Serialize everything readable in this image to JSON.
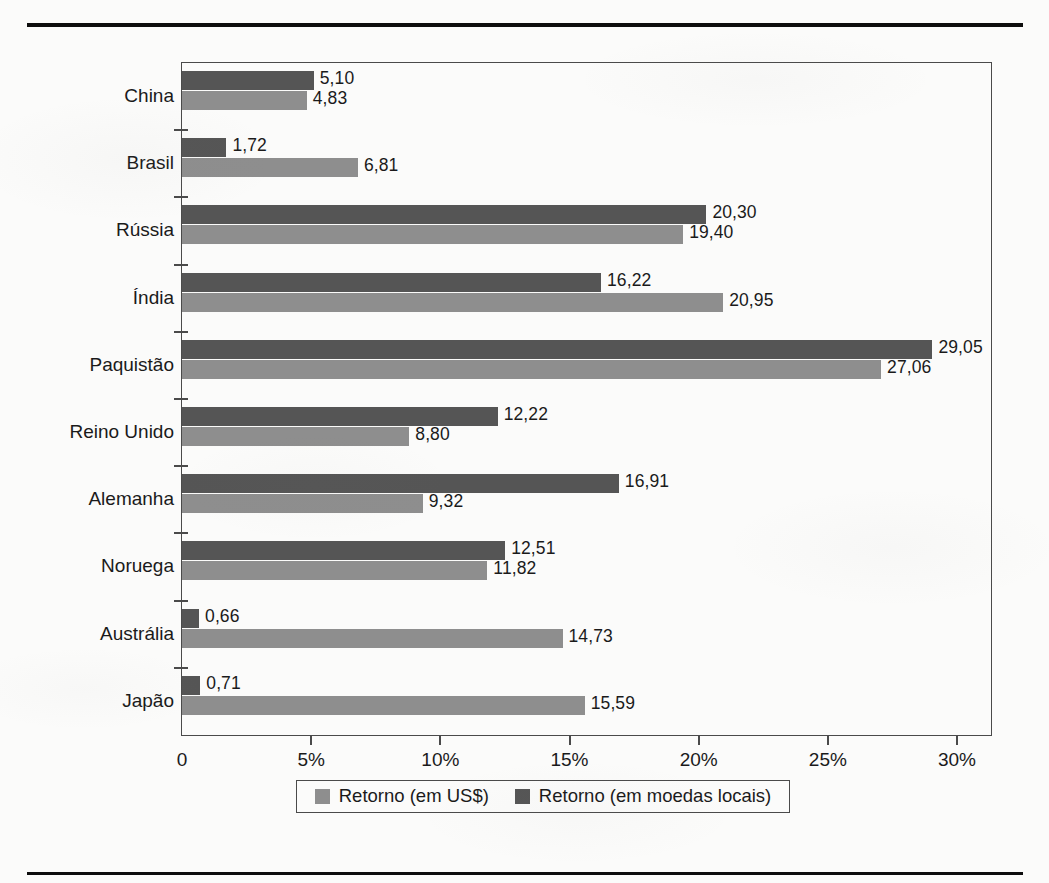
{
  "chart_data": {
    "type": "bar",
    "orientation": "horizontal",
    "title": "",
    "subtitle": "",
    "xlabel": "",
    "ylabel": "",
    "xlim": [
      0,
      30
    ],
    "xtick_labels": [
      "0",
      "5%",
      "10%",
      "15%",
      "20%",
      "25%",
      "30%"
    ],
    "xtick_values": [
      0,
      5,
      10,
      15,
      20,
      25,
      30
    ],
    "grid": false,
    "legend_position": "bottom",
    "categories": [
      "China",
      "Brasil",
      "Rússia",
      "Índia",
      "Paquistão",
      "Reino Unido",
      "Alemanha",
      "Noruega",
      "Austrália",
      "Japão"
    ],
    "series": [
      {
        "name": "Retorno (em moedas locais)",
        "color": "#555555",
        "values": [
          5.1,
          1.72,
          20.3,
          16.22,
          29.05,
          12.22,
          16.91,
          12.51,
          0.66,
          0.71
        ],
        "labels": [
          "5,10",
          "1,72",
          "20,30",
          "16,22",
          "29,05",
          "12,22",
          "16,91",
          "12,51",
          "0,66",
          "0,71"
        ]
      },
      {
        "name": "Retorno (em US$)",
        "color": "#8e8e8e",
        "values": [
          4.83,
          6.81,
          19.4,
          20.95,
          27.06,
          8.8,
          9.32,
          11.82,
          14.73,
          15.59
        ],
        "labels": [
          "4,83",
          "6,81",
          "19,40",
          "20,95",
          "27,06",
          "8,80",
          "9,32",
          "11,82",
          "14,73",
          "15,59"
        ]
      }
    ]
  },
  "legend": {
    "items": [
      {
        "label": "Retorno (em US$)",
        "swatch": "usd"
      },
      {
        "label": "Retorno (em moedas locais)",
        "swatch": "local"
      }
    ]
  },
  "colors": {
    "series_local": "#555555",
    "series_usd": "#8e8e8e",
    "axis": "#4a4a4a",
    "text": "#1a1a1a",
    "rule": "#0d0d0d",
    "page": "#fbfbfa"
  }
}
